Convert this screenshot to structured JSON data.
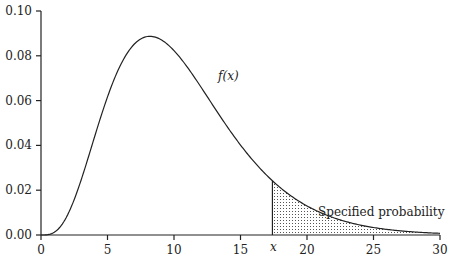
{
  "chart_data": {
    "type": "area",
    "title": "",
    "xlabel": "",
    "ylabel": "",
    "xlim": [
      0,
      30
    ],
    "ylim": [
      0,
      0.1
    ],
    "x_ticks": [
      "0",
      "5",
      "10",
      "15",
      "20",
      "25",
      "30"
    ],
    "y_ticks": [
      "0.00",
      "0.02",
      "0.04",
      "0.06",
      "0.08",
      "0.10"
    ],
    "grid": false,
    "legend": null,
    "series": [
      {
        "name": "f(x)",
        "x": [
          0,
          1,
          2,
          3,
          4,
          5,
          6,
          7,
          8,
          9,
          10,
          11,
          12,
          13,
          14,
          15,
          16,
          17,
          18,
          19,
          20,
          21,
          22,
          23,
          24,
          25,
          26,
          27,
          28,
          29,
          30
        ],
        "values": [
          0.0,
          0.0012,
          0.0087,
          0.0229,
          0.0402,
          0.0575,
          0.0719,
          0.0821,
          0.0876,
          0.0887,
          0.086,
          0.0805,
          0.0731,
          0.0648,
          0.0561,
          0.0477,
          0.0399,
          0.0329,
          0.0268,
          0.0215,
          0.0171,
          0.0135,
          0.0106,
          0.0082,
          0.0063,
          0.0048,
          0.0037,
          0.0028,
          0.0021,
          0.0016,
          0.0012
        ]
      }
    ],
    "shaded_region": {
      "from": 17.4,
      "to": 30,
      "pattern": "dotted",
      "label": "Specified probability"
    },
    "annotations": [
      {
        "text": "f(x)",
        "x": 12.5,
        "y": 0.065
      },
      {
        "text": "Specified probability",
        "x": 21.5,
        "y": 0.014
      },
      {
        "text": "x",
        "x": 17.4,
        "y": -0.008
      }
    ]
  },
  "labels": {
    "curve": "f(x)",
    "region": "Specified probability",
    "x_marker": "x"
  }
}
